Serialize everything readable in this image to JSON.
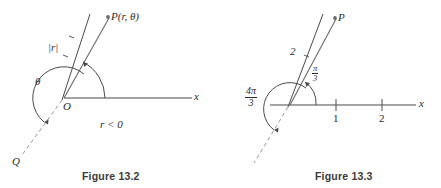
{
  "document": {
    "kind": "textbook-figure-pair",
    "background_color": "#ffffff",
    "ink_color": "#2b2b2b"
  },
  "figures": [
    {
      "id": "figure-13-2",
      "caption": "Figure 13.2",
      "labels": {
        "point_p": "P(r, θ)",
        "segment_r": "|r|",
        "angle_theta": "θ",
        "origin": "O",
        "axis_x": "x",
        "condition": "r < 0",
        "point_q": "Q"
      }
    },
    {
      "id": "figure-13-3",
      "caption": "Figure 13.3",
      "labels": {
        "point_p": "P",
        "segment_length": "2",
        "axis_x": "x",
        "tick_one": "1",
        "tick_two": "2"
      },
      "angle_reflex": {
        "numerator": "4π",
        "denominator": "3"
      },
      "angle_acute": {
        "numerator": "π",
        "denominator": "3"
      }
    }
  ]
}
